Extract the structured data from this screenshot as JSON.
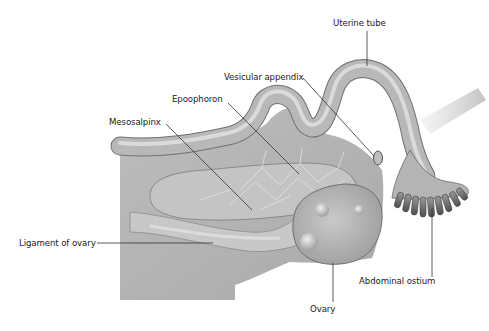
{
  "figure": {
    "colors": {
      "background": "#ffffff",
      "tissue": "#b9b9b9",
      "tissue_dark": "#8d8d8d",
      "label_text": "#222222",
      "leader_line": "#333333"
    }
  },
  "labels": [
    {
      "id": "uterine-tube",
      "text": "Uterine tube"
    },
    {
      "id": "vesicular-appendix",
      "text": "Vesicular appendix"
    },
    {
      "id": "epoophoron",
      "text": "Epoophoron"
    },
    {
      "id": "mesosalpinx",
      "text": "Mesosalpinx"
    },
    {
      "id": "ligament-of-ovary",
      "text": "Ligament of ovary"
    },
    {
      "id": "abdominal-ostium",
      "text": "Abdominal ostium"
    },
    {
      "id": "ovary",
      "text": "Ovary"
    }
  ]
}
